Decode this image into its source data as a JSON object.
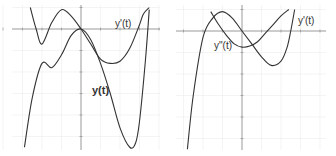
{
  "chart_data": [
    {
      "type": "line",
      "title": "",
      "xlabel": "t",
      "ylabel": "",
      "xlim": [
        -4,
        4
      ],
      "ylim": [
        -6,
        1
      ],
      "grid": true,
      "x_ticks": [
        -4,
        -3,
        -2,
        -1,
        0,
        1,
        2,
        3,
        4
      ],
      "series": [
        {
          "name": "y(t)",
          "x": [
            -2.9,
            -2.5,
            -2,
            -1.5,
            -1,
            -0.5,
            0,
            0.5,
            1,
            1.5,
            2,
            2.5,
            2.8,
            3,
            3.3,
            3.5
          ],
          "values": [
            -5.5,
            -3.2,
            -1.6,
            -1.8,
            -1.2,
            -0.3,
            0,
            -0.5,
            -1.6,
            -3,
            -4.6,
            -5.5,
            -5.3,
            -4.3,
            -1.5,
            0.9
          ]
        },
        {
          "name": "y'(t)",
          "x": [
            -2.6,
            -2.3,
            -2,
            -1.5,
            -1,
            -0.5,
            0,
            0.5,
            1,
            1.5,
            2,
            2.5,
            3,
            3.2,
            3.5
          ],
          "values": [
            1,
            0,
            -0.7,
            0.3,
            0.9,
            0.6,
            0,
            -0.7,
            -1.4,
            -1.6,
            -1.5,
            -0.9,
            0.2,
            0.7,
            1
          ]
        }
      ],
      "annotations": [
        {
          "text": "y'(t)",
          "x": 2.6,
          "y": 0.3
        },
        {
          "text": "y(t)",
          "x": 0.6,
          "y": -2.8
        }
      ]
    },
    {
      "type": "line",
      "title": "",
      "xlabel": "t",
      "ylabel": "",
      "xlim": [
        -4,
        4
      ],
      "ylim": [
        -6,
        1
      ],
      "grid": true,
      "x_ticks": [
        -4,
        -3,
        -2,
        -1,
        0,
        1,
        2,
        3,
        4
      ],
      "series": [
        {
          "name": "y'(t)",
          "x": [
            -2.8,
            -2.5,
            -2,
            -1.5,
            -1,
            -0.5,
            0,
            0.5,
            1,
            1.5,
            2,
            2.3,
            2.5,
            2.7
          ],
          "values": [
            -5.5,
            -3,
            -0.3,
            0.6,
            0.9,
            0.6,
            0,
            -0.6,
            -1.2,
            -1.6,
            -1.4,
            -0.8,
            0,
            1
          ]
        },
        {
          "name": "y''(t)",
          "x": [
            -1.6,
            -1.2,
            -0.8,
            -0.4,
            0,
            0.4,
            0.8,
            1.2,
            1.6,
            2,
            2.4
          ],
          "values": [
            0.9,
            0.3,
            -0.2,
            -0.6,
            -0.75,
            -0.7,
            -0.5,
            -0.1,
            0.3,
            0.7,
            1
          ]
        }
      ],
      "annotations": [
        {
          "text": "y'(t)",
          "x": 2.6,
          "y": 0.3
        },
        {
          "text": "y\"(t)",
          "x": -1.4,
          "y": -0.7
        }
      ]
    }
  ],
  "panels": {
    "left": {
      "label_a": "y'(t)",
      "label_b": "y(t)"
    },
    "right": {
      "label_a": "y'(t)",
      "label_b": "y\"(t)"
    }
  }
}
